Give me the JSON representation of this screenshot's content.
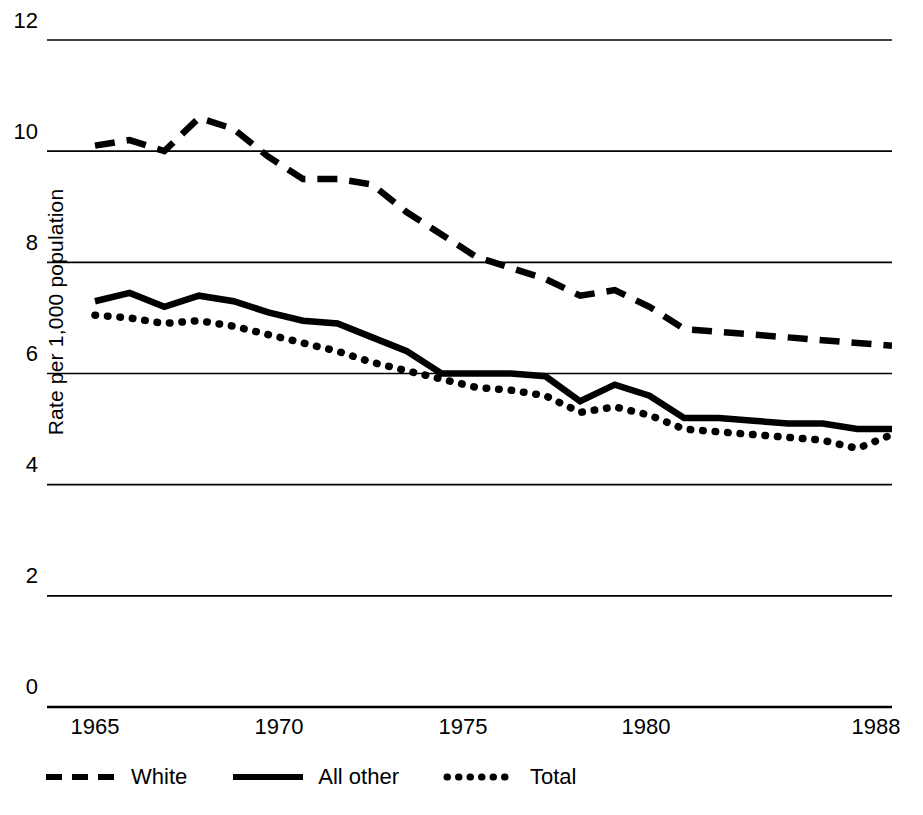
{
  "chart_data": {
    "type": "line",
    "title": "",
    "xlabel": "",
    "ylabel": "Rate per 1,000 population",
    "xlim": [
      1965,
      1988
    ],
    "ylim": [
      0,
      12
    ],
    "yticks": [
      12,
      10,
      8,
      6,
      4,
      2,
      0
    ],
    "xticks": [
      1965,
      1970,
      1975,
      1980,
      1988
    ],
    "grid": "horizontal",
    "legend_position": "below-axis",
    "x": [
      1965,
      1966,
      1967,
      1968,
      1969,
      1970,
      1971,
      1972,
      1973,
      1974,
      1975,
      1976,
      1977,
      1978,
      1979,
      1980,
      1981,
      1982,
      1983,
      1984,
      1985,
      1986,
      1987,
      1988
    ],
    "series": [
      {
        "name": "White",
        "style": "dashed",
        "values": [
          10.1,
          10.2,
          10.0,
          10.6,
          10.4,
          9.9,
          9.5,
          9.5,
          9.4,
          8.9,
          8.5,
          8.1,
          7.9,
          7.7,
          7.4,
          7.5,
          7.2,
          6.8,
          6.75,
          6.7,
          6.65,
          6.6,
          6.55,
          6.5
        ]
      },
      {
        "name": "All other",
        "style": "solid",
        "values": [
          7.3,
          7.45,
          7.2,
          7.4,
          7.3,
          7.1,
          6.95,
          6.9,
          6.65,
          6.4,
          6.0,
          6.0,
          6.0,
          5.95,
          5.5,
          5.8,
          5.6,
          5.2,
          5.2,
          5.15,
          5.1,
          5.1,
          5.0,
          5.0
        ]
      },
      {
        "name": "Total",
        "style": "dotted",
        "values": [
          7.05,
          7.0,
          6.9,
          6.95,
          6.85,
          6.7,
          6.55,
          6.4,
          6.2,
          6.05,
          5.9,
          5.75,
          5.7,
          5.6,
          5.3,
          5.4,
          5.25,
          5.0,
          4.95,
          4.9,
          4.85,
          4.8,
          4.65,
          4.9
        ]
      }
    ]
  },
  "axis": {
    "y_title": "Rate per 1,000 population",
    "y_tick_labels": [
      "12",
      "10",
      "8",
      "6",
      "4",
      "2",
      "0"
    ],
    "x_tick_labels": [
      "1965",
      "1970",
      "1975",
      "1980",
      "1988"
    ]
  },
  "legend": {
    "items": [
      {
        "label": "White",
        "style": "dashed"
      },
      {
        "label": "All other",
        "style": "solid"
      },
      {
        "label": "Total",
        "style": "dotted"
      }
    ]
  },
  "colors": {
    "line": "#000000",
    "grid": "#000000",
    "background": "#ffffff"
  }
}
